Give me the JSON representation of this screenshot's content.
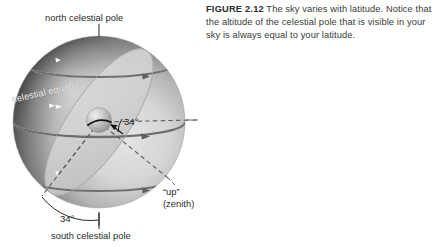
{
  "figure": {
    "number_label": "FIGURE 2.12",
    "caption_text": " The sky varies with latitude. Notice that the altitude of the celestial pole that is visible in your sky is always equal to your latitude."
  },
  "diagram": {
    "labels": {
      "north_celestial_pole": "north celestial pole",
      "south_celestial_pole": "south celestial pole",
      "celestial_equator": "celestial equator",
      "zenith_primary": "“up”",
      "zenith_secondary": "(zenith)",
      "angle_center": "34°",
      "angle_bottom": "34°"
    },
    "colors": {
      "sphere_dark": "#1c1c1c",
      "sphere_light": "#dcdcdc",
      "horizon_plane": "#c9c9c9",
      "circle_line_dark": "#6e6e6e",
      "circle_line_light": "#f5f5f5",
      "dashed_line": "#5d5d5d",
      "caption_text": "#3a3a3a",
      "background": "#ffffff"
    },
    "geometry": {
      "sphere_center_x": 99,
      "sphere_center_y": 122,
      "sphere_radius": 86,
      "latitude_angle_degrees": 34
    }
  }
}
